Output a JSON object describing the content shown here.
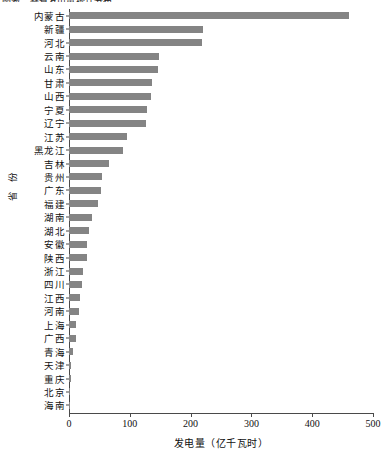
{
  "top_caption": "图表：各省发电量统计分布",
  "chart_data": {
    "type": "bar",
    "orientation": "horizontal",
    "title": "",
    "xlabel": "发电量（亿千瓦时）",
    "ylabel": "省 份",
    "xlim": [
      0,
      500
    ],
    "ylim": null,
    "grid": false,
    "legend": null,
    "bar_color": "#848484",
    "axis_color": "#4a4a4a",
    "xticks": [
      0,
      100,
      200,
      300,
      400,
      500
    ],
    "xticklabels": [
      "0",
      "100",
      "200",
      "300",
      "400",
      "500"
    ],
    "categories": [
      "内蒙古",
      "新疆",
      "河北",
      "云南",
      "山东",
      "甘肃",
      "山西",
      "宁夏",
      "辽宁",
      "江苏",
      "黑龙江",
      "吉林",
      "贵州",
      "广东",
      "福建",
      "湖南",
      "湖北",
      "安徽",
      "陕西",
      "浙江",
      "四川",
      "江西",
      "河南",
      "上海",
      "广西",
      "青海",
      "天津",
      "重庆",
      "北京",
      "海南"
    ],
    "values": [
      460,
      220,
      219,
      148,
      147,
      136,
      135,
      128,
      127,
      96,
      89,
      65,
      55,
      52,
      48,
      37,
      33,
      30,
      29,
      23,
      21,
      18,
      16,
      12,
      11,
      7,
      4,
      2.5,
      2,
      1.5
    ]
  }
}
